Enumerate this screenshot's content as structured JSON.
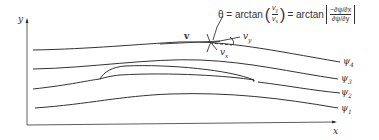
{
  "axes": {
    "x_label": "x",
    "y_label": "y"
  },
  "vectors": {
    "velocity_label": "v",
    "vx_label": "v",
    "vx_sub": "x",
    "vy_label": "v",
    "vy_sub": "y"
  },
  "equation": {
    "lhs": "θ = arctan",
    "ratio_num": "v",
    "ratio_num_sub": "y",
    "ratio_den": "v",
    "ratio_den_sub": "x",
    "mid": "= arctan",
    "bracket_num": "−∂ψ/∂x",
    "bracket_den": "∂ψ/∂y"
  },
  "streamlines": [
    {
      "label": "ψ",
      "sub": "4"
    },
    {
      "label": "ψ",
      "sub": "3"
    },
    {
      "label": "ψ",
      "sub": "2"
    },
    {
      "label": "ψ",
      "sub": "1"
    }
  ],
  "colors": {
    "line": "#333333",
    "background": "#ffffff"
  }
}
